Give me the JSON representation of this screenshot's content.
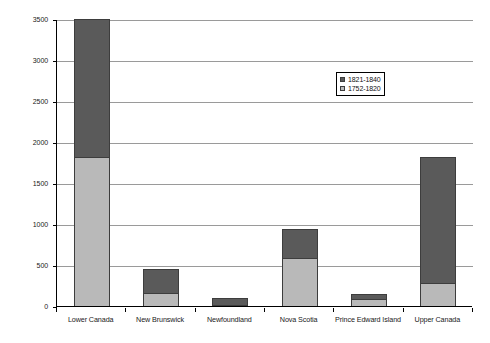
{
  "chart_data": {
    "type": "bar",
    "subtype": "stacked-column",
    "title": "",
    "xlabel": "",
    "ylabel": "Number of titles",
    "ylim": [
      0,
      3500
    ],
    "ytick_step": 500,
    "yticks": [
      "3500",
      "3000",
      "2500",
      "2000",
      "1500",
      "1000",
      "500",
      "0"
    ],
    "grid": true,
    "legend_position": "inside-upper-right",
    "categories": [
      "Lower Canada",
      "New Brunswick",
      "Newfoundland",
      "Nova Scotia",
      "Prince Edward Island",
      "Upper Canada"
    ],
    "series": [
      {
        "name": "1752-1820",
        "color": "#b9b9b9",
        "values": [
          1820,
          160,
          5,
          580,
          90,
          275
        ]
      },
      {
        "name": "1821-1840",
        "color": "#5a5a5a",
        "values": [
          1680,
          290,
          80,
          365,
          60,
          1545
        ]
      }
    ],
    "totals": [
      3500,
      450,
      85,
      945,
      150,
      1820
    ]
  },
  "legend": {
    "items": [
      {
        "label": "1821-1840",
        "color": "#5a5a5a"
      },
      {
        "label": "1752-1820",
        "color": "#b9b9b9"
      }
    ]
  },
  "axis": {
    "y_title": "Number of titles"
  },
  "colors": {
    "series_late": "#5a5a5a",
    "series_early": "#b9b9b9",
    "gridline": "#9a9a9a",
    "axis": "#000000",
    "background": "#ffffff"
  }
}
